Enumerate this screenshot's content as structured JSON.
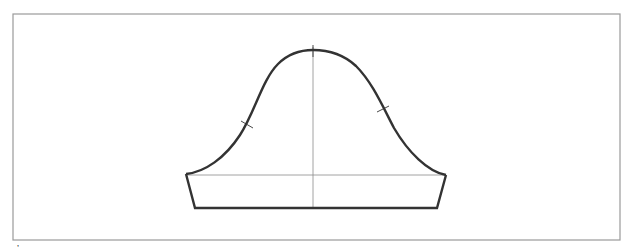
{
  "figure": {
    "caption_fragment": "’",
    "colors": {
      "frame": "#9a9a9a",
      "outline": "#333333",
      "guide": "#8a8a8a",
      "background": "#ffffff"
    }
  },
  "frame": {
    "x": 13,
    "y": 14,
    "width": 607,
    "height": 226
  },
  "sleeve": {
    "cap_path": "M 186 174 C 205 172, 225 158, 240 135 C 255 112, 262 80, 278 64 C 290 52, 302 50, 313 50 C 326 50, 342 53, 356 66 C 372 82, 382 105, 394 128 C 408 152, 428 172, 446 175",
    "band_points": "186,174 195,208 437,208 446,175",
    "center_line": {
      "x1": 313,
      "y1": 47,
      "x2": 313,
      "y2": 208
    },
    "bicep_line": {
      "x1": 186,
      "y1": 175,
      "x2": 446,
      "y2": 175
    },
    "notches": [
      {
        "name": "top-notch",
        "x1": 313,
        "y1": 45,
        "x2": 313,
        "y2": 57
      },
      {
        "name": "front-notch",
        "x1": 241,
        "y1": 121,
        "x2": 253,
        "y2": 128
      },
      {
        "name": "back-notch",
        "x1": 377,
        "y1": 112,
        "x2": 389,
        "y2": 106
      }
    ]
  }
}
